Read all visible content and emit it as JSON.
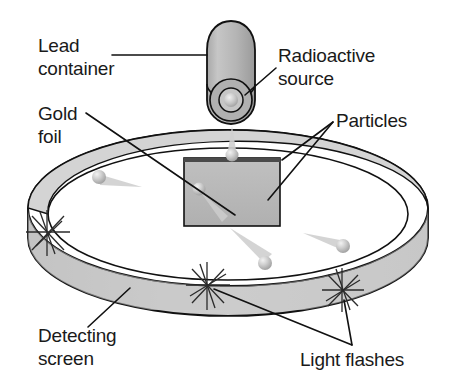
{
  "figure": {
    "background_color": "#ffffff",
    "width": 449,
    "height": 383
  },
  "labels": {
    "lead_container": {
      "line1": "Lead",
      "line2": "container",
      "x": 38,
      "y": 52
    },
    "radioactive_source": {
      "line1": "Radioactive",
      "line2": "source",
      "x": 278,
      "y": 62
    },
    "gold_foil": {
      "line1": "Gold",
      "line2": "foil",
      "x": 38,
      "y": 120
    },
    "particles": {
      "line1": "Particles",
      "x": 336,
      "y": 127
    },
    "detecting_screen": {
      "line1": "Detecting",
      "line2": "screen",
      "x": 38,
      "y": 342
    },
    "light_flashes": {
      "line1": "Light flashes",
      "x": 300,
      "y": 366
    }
  },
  "parts": {
    "lead_container_name": "lead-container",
    "radioactive_source_name": "radioactive-source",
    "gold_foil_name": "gold-foil",
    "detecting_screen_name": "detecting-screen",
    "particle_name": "alpha-particle",
    "flash_name": "light-flash"
  },
  "colors": {
    "outline": "#111111",
    "cylinder_fill": "#b3b3b3",
    "cylinder_shade": "#9a9a9a",
    "source_core": "#d8d8d8",
    "ring_outer": "#c9c9c9",
    "ring_inner": "#bdbdbd",
    "ring_top": "#d4d4d4",
    "foil_fill": "#b8b8b8",
    "foil_top_edge": "#4a4a4a",
    "particle_light": "#e8e8e8",
    "particle_mid": "#b5b5b5",
    "tail_fill": "#c4c4c4",
    "text": "#1a1a1a"
  },
  "counts": {
    "particles": 5,
    "light_flashes": 3
  }
}
